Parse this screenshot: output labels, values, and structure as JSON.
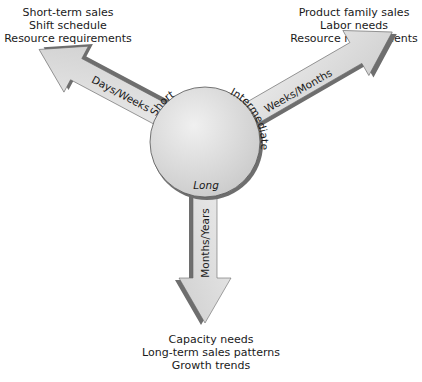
{
  "diagram": {
    "center_circle": {
      "labels": {
        "short": "Short",
        "intermediate": "Intermediate",
        "long": "Long"
      }
    },
    "arrows": [
      {
        "id": "short",
        "direction": "up-left",
        "label": "Days/Weeks",
        "outcomes": [
          "Short-term sales",
          "Shift schedule",
          "Resource requirements"
        ]
      },
      {
        "id": "intermediate",
        "direction": "up-right",
        "label": "Weeks/Months",
        "outcomes": [
          "Product family sales",
          "Labor needs",
          "Resource requirements"
        ]
      },
      {
        "id": "long",
        "direction": "down",
        "label": "Months/Years",
        "outcomes": [
          "Capacity needs",
          "Long-term sales patterns",
          "Growth trends"
        ]
      }
    ],
    "colors": {
      "fill": "#dcdcdc",
      "shadow": "#6e6e6e",
      "outline": "#555555",
      "text": "#1a1a1a"
    }
  }
}
